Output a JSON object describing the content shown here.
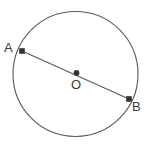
{
  "figure": {
    "name": "circle-with-diameter",
    "background_color": "#ffffff",
    "stroke_color": "#595959",
    "marker_color": "#333333",
    "label_color": "#3a3a3a",
    "stroke_width": 1
  },
  "circle": {
    "center_x": 75.5,
    "center_y": 74,
    "radius": 62.5
  },
  "points": [
    {
      "id": "A",
      "label": "A",
      "x": 22,
      "y": 51,
      "marker": "square-dot"
    },
    {
      "id": "O",
      "label": "O",
      "x": 76.5,
      "y": 73,
      "marker": "round-dot"
    },
    {
      "id": "B",
      "label": "B",
      "x": 129,
      "y": 99,
      "marker": "square-dot"
    }
  ],
  "segments": [
    {
      "id": "diameter-AB",
      "from": "A",
      "to": "B",
      "label": ""
    }
  ],
  "labels": {
    "point_a": "A",
    "point_o": "O",
    "point_b": "B"
  }
}
